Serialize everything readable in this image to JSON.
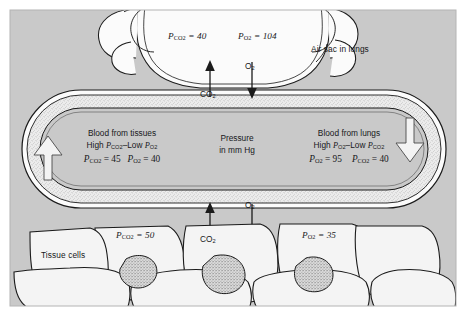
{
  "figure": {
    "panel_background": "#c9c9c9",
    "structure_fill": "#f2f2f2",
    "line_color": "#1b1b1b"
  },
  "lung": {
    "label": "Air sac in lungs",
    "pco2": {
      "symbol": "P",
      "sub": "CO2",
      "text": "P_CO2 = 40",
      "value": 40,
      "display_prefix": "P",
      "display_sub": "CO",
      "display_sub2": "2",
      "display_rest": " = 40"
    },
    "po2": {
      "text": "P_O2 = 104",
      "value": 104,
      "display_prefix": "P",
      "display_sub": "O",
      "display_sub2": "2",
      "display_rest": " = 104"
    }
  },
  "lung_exchange": {
    "co2_label": "CO",
    "co2_sub": "2",
    "o2_label": "O",
    "o2_sub": "2",
    "co2_direction": "up",
    "o2_direction": "down"
  },
  "vessel": {
    "left_block": {
      "line1": "Blood from tissues",
      "line2_prefix": "High ",
      "line2_a": "P",
      "line2_a_sub": "CO",
      "line2_a_sub2": "2",
      "line2_mid": "–Low ",
      "line2_b": "P",
      "line2_b_sub": "O",
      "line2_b_sub2": "2",
      "line3_a": "P",
      "line3_a_sub": "CO",
      "line3_a_sub2": "2",
      "line3_a_val": " = 45",
      "line3_b": "P",
      "line3_b_sub": "O",
      "line3_b_sub2": "2",
      "line3_b_val": " = 40",
      "pco2_value": 45,
      "po2_value": 40
    },
    "center_block": {
      "line1": "Pressure",
      "line2": "in mm Hg"
    },
    "right_block": {
      "line1": "Blood from lungs",
      "line2_prefix": "High ",
      "line2_a": "P",
      "line2_a_sub": "O",
      "line2_a_sub2": "2",
      "line2_mid": "–Low ",
      "line2_b": "P",
      "line2_b_sub": "CO",
      "line2_b_sub2": "2",
      "line3_a": "P",
      "line3_a_sub": "O",
      "line3_a_sub2": "2",
      "line3_a_val": " = 95",
      "line3_b": "P",
      "line3_b_sub": "CO",
      "line3_b_sub2": "2",
      "line3_b_val": " = 40",
      "po2_value": 95,
      "pco2_value": 40
    },
    "flow_left_direction": "up",
    "flow_right_direction": "down"
  },
  "tissue": {
    "label": "Tissue cells",
    "cell_left": {
      "prefix": "P",
      "sub": "CO",
      "sub2": "2",
      "rest": " = 50",
      "value": 50
    },
    "cell_right": {
      "prefix": "P",
      "sub": "O",
      "sub2": "2",
      "rest": " = 35",
      "value": 35
    },
    "co2_label": "CO",
    "co2_sub": "2",
    "o2_label": "O",
    "o2_sub": "2",
    "co2_direction": "up",
    "o2_direction": "down"
  }
}
